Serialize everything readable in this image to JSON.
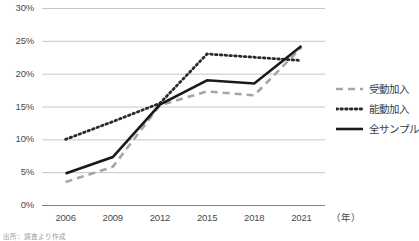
{
  "chart_data": {
    "type": "line",
    "title": "",
    "xlabel": "(年)",
    "ylabel": "",
    "x": [
      2006,
      2009,
      2012,
      2015,
      2018,
      2021
    ],
    "categories": [
      "2006",
      "2009",
      "2012",
      "2015",
      "2018",
      "2021"
    ],
    "ylim": [
      0,
      30
    ],
    "ytick_labels": [
      "0%",
      "5%",
      "10%",
      "15%",
      "20%",
      "25%",
      "30%"
    ],
    "ytick_values": [
      0,
      5,
      10,
      15,
      20,
      25,
      30
    ],
    "grid": true,
    "legend_position": "right",
    "series": [
      {
        "name": "受動加入",
        "style": "dashed",
        "color": "#a6a6a6",
        "values": [
          3.5,
          5.8,
          15.2,
          17.3,
          16.7,
          24.0
        ]
      },
      {
        "name": "能動加入",
        "style": "dotted",
        "color": "#2b2b2b",
        "values": [
          10.0,
          12.7,
          15.5,
          23.0,
          22.5,
          22.0
        ]
      },
      {
        "name": "全サンプル",
        "style": "solid",
        "color": "#1a1a1a",
        "values": [
          4.8,
          7.3,
          15.3,
          19.0,
          18.5,
          24.2
        ]
      }
    ]
  },
  "axes": {
    "y_ticks": [
      {
        "label": "30%",
        "value": 30
      },
      {
        "label": "25%",
        "value": 25
      },
      {
        "label": "20%",
        "value": 20
      },
      {
        "label": "15%",
        "value": 15
      },
      {
        "label": "10%",
        "value": 10
      },
      {
        "label": "5%",
        "value": 5
      },
      {
        "label": "0%",
        "value": 0
      }
    ],
    "x_ticks": [
      {
        "label": "2006"
      },
      {
        "label": "2009"
      },
      {
        "label": "2012"
      },
      {
        "label": "2015"
      },
      {
        "label": "2018"
      },
      {
        "label": "2021"
      }
    ],
    "x_unit": "（年）"
  },
  "legend": {
    "items": [
      {
        "label": "受動加入",
        "style": "dashed",
        "color": "#a6a6a6"
      },
      {
        "label": "能動加入",
        "style": "dotted",
        "color": "#2b2b2b"
      },
      {
        "label": "全サンプル",
        "style": "solid",
        "color": "#1a1a1a"
      }
    ]
  },
  "footer": {
    "source_note": "出所：調査より作成"
  },
  "colors": {
    "grid": "#bfbfbf",
    "axis": "#808080",
    "text": "#4a4a4a"
  }
}
